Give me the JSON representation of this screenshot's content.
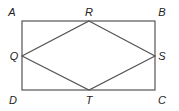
{
  "diagram": {
    "type": "rectangle with inscribed rhombus",
    "line_color": "#555555",
    "label_color": "#222222",
    "rectangle": {
      "vertices": [
        "A",
        "B",
        "C",
        "D"
      ]
    },
    "rhombus": {
      "vertices": [
        "R",
        "S",
        "T",
        "Q"
      ]
    },
    "labels": {
      "A": "A",
      "B": "B",
      "C": "C",
      "D": "D",
      "Q": "Q",
      "R": "R",
      "S": "S",
      "T": "T"
    }
  }
}
